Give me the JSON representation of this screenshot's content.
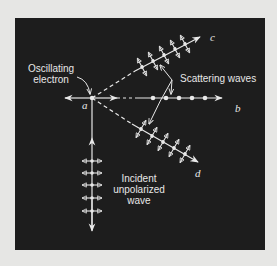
{
  "figure": {
    "background_color": "#1d1d1d",
    "foreground_color": "#e8e8e8",
    "page_color": "#e6e6e4",
    "labels": {
      "oscillating_electron": "Oscillating\nelectron",
      "oscillating_electron_line1": "Oscillating",
      "oscillating_electron_line2": "electron",
      "scattering_waves": "Scattering waves",
      "incident_line1": "Incident",
      "incident_line2": "unpolarized",
      "incident_line3": "wave",
      "point_a": "a",
      "direction_b": "b",
      "direction_c": "c",
      "direction_d": "d"
    },
    "elements": {
      "electron_position": [
        92,
        98
      ],
      "incident_wave": {
        "direction": "up",
        "polarization_markers": 5,
        "marker_type": "double-headed horizontal arrows with dots"
      },
      "scattered_c": {
        "direction": "upper-right",
        "polarization_markers": 5,
        "marker_type": "double-headed arrows perpendicular to ray"
      },
      "scattered_b": {
        "direction": "right",
        "polarization_markers": 5,
        "marker_type": "dots (out of plane)"
      },
      "scattered_d": {
        "direction": "lower-right",
        "polarization_markers": 5,
        "marker_type": "double-headed arrows perpendicular to ray"
      }
    }
  }
}
